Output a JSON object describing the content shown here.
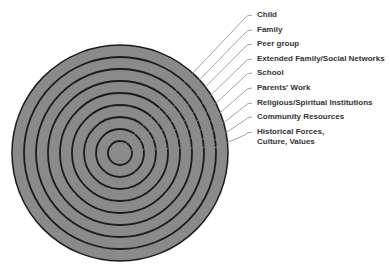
{
  "diagram": {
    "type": "concentric-circles",
    "center": [
      120,
      153
    ],
    "ring_spacing": 12,
    "ring_count": 9,
    "colors": {
      "fill": "#8a8a8a",
      "ring_stroke": "#1c1c1c",
      "leader": "#8c8c8c",
      "text": "#333333"
    },
    "labels": [
      {
        "text": "Child",
        "y": 15
      },
      {
        "text": "Family",
        "y": 30
      },
      {
        "text": "Peer group",
        "y": 44
      },
      {
        "text": "Extended Family/Social Networks",
        "y": 59
      },
      {
        "text": "School",
        "y": 73
      },
      {
        "text": "Parents' Work",
        "y": 88
      },
      {
        "text": "Religious/Spiritual Institutions",
        "y": 103
      },
      {
        "text": "Community Resources",
        "y": 117
      },
      {
        "text": "Historical Forces,",
        "y": 132
      }
    ],
    "label_continuation": {
      "text": "Culture, Values",
      "y": 141
    }
  }
}
